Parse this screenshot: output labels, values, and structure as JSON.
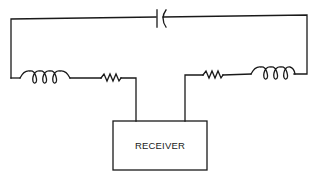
{
  "diagram": {
    "type": "circuit-schematic",
    "receiver": {
      "label": "RECEIVER"
    },
    "components": [
      {
        "id": "capacitor",
        "kind": "capacitor",
        "position": "top-center"
      },
      {
        "id": "inductor-left",
        "kind": "inductor",
        "position": "left-branch"
      },
      {
        "id": "resistor-left",
        "kind": "resistor",
        "position": "left-branch"
      },
      {
        "id": "resistor-right",
        "kind": "resistor",
        "position": "right-branch"
      },
      {
        "id": "inductor-right",
        "kind": "inductor",
        "position": "right-branch"
      }
    ],
    "colors": {
      "line": "#1a1a1a",
      "background": "#ffffff"
    }
  }
}
